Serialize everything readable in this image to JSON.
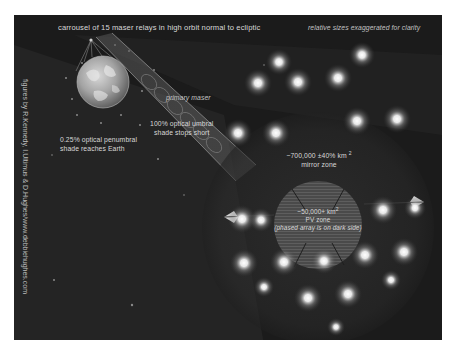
{
  "figure": {
    "title": "carrousel of 15 maser relays in high orbit normal to ecliptic",
    "note": "relative sizes exaggerated for clarity",
    "credit": "figures by R.Kennedy, I.Ultimus & D.Hughes/www.debbiehughes.com",
    "background_color": "#1b1b1b",
    "label_color": "#d8d8d8"
  },
  "labels": {
    "primary_maser": "primary maser",
    "umbral_line1": "100% optical umbral",
    "umbral_line2": "shade stops short",
    "penumbral_line1": "0.25% optical  penumbral",
    "penumbral_line2": "shade reaches Earth",
    "mirror_zone_value": "~700,000 ±40% km",
    "mirror_zone_exp": "2",
    "mirror_zone_name": "mirror zone",
    "pv_zone_value": "~50,000+ km",
    "pv_zone_exp": "2",
    "pv_zone_name": "PV zone",
    "pv_zone_note": "(phased array is on dark side)"
  },
  "objects": {
    "earth": {
      "name": "Earth",
      "cx": 89,
      "cy": 67,
      "r": 26
    },
    "relay_source": {
      "cx": 77,
      "cy": 25
    },
    "mirror_zone": {
      "cx": 304,
      "cy": 213,
      "r": 116
    },
    "pv_zone": {
      "cx": 304,
      "cy": 210,
      "r": 44
    },
    "lights": [
      [
        86,
        27
      ],
      [
        166,
        22
      ],
      [
        205,
        22
      ],
      [
        245,
        21
      ],
      [
        28,
        62
      ],
      [
        68,
        60
      ],
      [
        108,
        55
      ],
      [
        150,
        37
      ],
      [
        245,
        50
      ],
      [
        284,
        58
      ],
      [
        36,
        108
      ],
      [
        72,
        108
      ],
      [
        250,
        97
      ],
      [
        288,
        95
      ],
      [
        39,
        151
      ],
      [
        79,
        150
      ],
      [
        120,
        149
      ],
      [
        156,
        145
      ],
      [
        196,
        145
      ],
      [
        238,
        143
      ],
      [
        64,
        177
      ],
      [
        100,
        185
      ],
      [
        141,
        182
      ],
      [
        230,
        168
      ],
      [
        136,
        209
      ]
    ]
  }
}
